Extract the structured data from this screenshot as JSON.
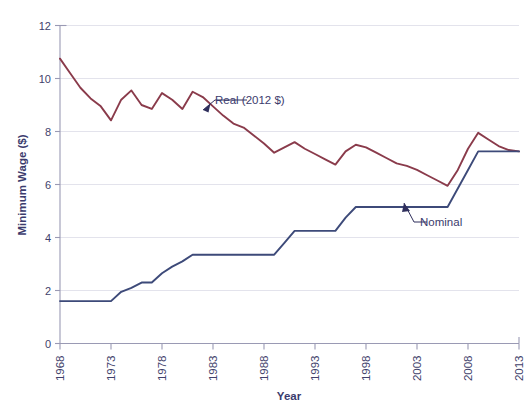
{
  "chart_data": {
    "type": "line",
    "title": "",
    "xlabel": "Year",
    "ylabel": "Minimum Wage ($)",
    "xlim": [
      1968,
      2013
    ],
    "ylim": [
      0,
      12
    ],
    "xticks": [
      "1968",
      "1973",
      "1978",
      "1983",
      "1988",
      "1993",
      "1998",
      "2003",
      "2008",
      "2013"
    ],
    "yticks": [
      "0",
      "2",
      "4",
      "6",
      "8",
      "10",
      "12"
    ],
    "grid": "horizontal",
    "legend_position": "inline-annotations",
    "colors": {
      "real": "#8a3b4b",
      "nominal": "#3d4a79",
      "text": "#3b3b6d",
      "grid": "#e3e3ec",
      "axis": "#9a9ab4",
      "background": "#ffffff"
    },
    "annotations": [
      {
        "name": "real-annotation",
        "label": "Real (2012 $)"
      },
      {
        "name": "nominal-annotation",
        "label": "Nominal"
      }
    ],
    "x": [
      1968,
      1969,
      1970,
      1971,
      1972,
      1973,
      1974,
      1975,
      1976,
      1977,
      1978,
      1979,
      1980,
      1981,
      1982,
      1983,
      1984,
      1985,
      1986,
      1987,
      1988,
      1989,
      1990,
      1991,
      1992,
      1993,
      1994,
      1995,
      1996,
      1997,
      1998,
      1999,
      2000,
      2001,
      2002,
      2003,
      2004,
      2005,
      2006,
      2007,
      2008,
      2009,
      2010,
      2011,
      2012,
      2013
    ],
    "series": [
      {
        "name": "Real (2012 $)",
        "color": "#8a3b4b",
        "values": [
          10.75,
          10.2,
          9.65,
          9.25,
          8.95,
          8.42,
          9.2,
          9.55,
          9.0,
          8.85,
          9.45,
          9.2,
          8.85,
          9.5,
          9.3,
          8.95,
          8.6,
          8.3,
          8.15,
          7.85,
          7.55,
          7.2,
          7.4,
          7.6,
          7.35,
          7.15,
          6.95,
          6.75,
          7.25,
          7.5,
          7.4,
          7.2,
          7.0,
          6.8,
          6.7,
          6.55,
          6.35,
          6.15,
          5.95,
          6.55,
          7.35,
          7.95,
          7.7,
          7.45,
          7.3,
          7.25
        ]
      },
      {
        "name": "Nominal",
        "color": "#3d4a79",
        "values": [
          1.6,
          1.6,
          1.6,
          1.6,
          1.6,
          1.6,
          1.95,
          2.1,
          2.3,
          2.3,
          2.65,
          2.9,
          3.1,
          3.35,
          3.35,
          3.35,
          3.35,
          3.35,
          3.35,
          3.35,
          3.35,
          3.35,
          3.8,
          4.25,
          4.25,
          4.25,
          4.25,
          4.25,
          4.75,
          5.15,
          5.15,
          5.15,
          5.15,
          5.15,
          5.15,
          5.15,
          5.15,
          5.15,
          5.15,
          5.85,
          6.55,
          7.25,
          7.25,
          7.25,
          7.25,
          7.25
        ]
      }
    ]
  }
}
